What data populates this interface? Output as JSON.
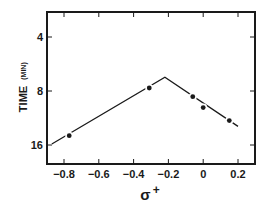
{
  "chart_data": {
    "type": "line",
    "title": "",
    "xlabel": "σ+",
    "xlabel_main": "σ",
    "xlabel_sup": "+",
    "ylabel": "TIME (MIN)",
    "ylabel_main": "TIME",
    "ylabel_unit": "(MIN)",
    "xlim": [
      -0.9,
      0.3
    ],
    "ylim": [
      18,
      2.8
    ],
    "yscale": "log2",
    "y_inverted": true,
    "grid": false,
    "legend": null,
    "x_ticks": [
      -0.8,
      -0.6,
      -0.4,
      -0.2,
      0,
      0.2
    ],
    "x_tick_labels": [
      "−0.8",
      "−0.6",
      "−0.4",
      "−0.2",
      "0",
      "0.2"
    ],
    "y_ticks": [
      4,
      8,
      16
    ],
    "y_tick_labels": [
      "4",
      "8",
      "16"
    ],
    "series": [
      {
        "name": "measured",
        "style": "markers",
        "x": [
          -0.77,
          -0.31,
          -0.06,
          0.0,
          0.15
        ],
        "y": [
          14.2,
          7.7,
          8.6,
          9.9,
          11.7
        ]
      },
      {
        "name": "fit",
        "style": "line",
        "x": [
          -0.87,
          -0.22,
          0.2
        ],
        "y": [
          15.8,
          6.7,
          12.6
        ]
      }
    ]
  },
  "colors": {
    "ink": "#1a1a1a",
    "background": "#ffffff"
  }
}
